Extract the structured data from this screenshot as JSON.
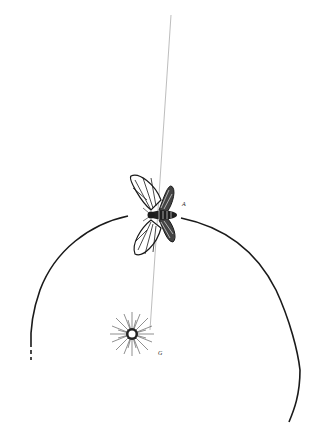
{
  "figure": {
    "labels": {
      "moth": "A",
      "light": "G"
    },
    "colors": {
      "ink": "#1a1a1a",
      "guide_line": "#9a9a9a",
      "background": "#ffffff"
    }
  }
}
